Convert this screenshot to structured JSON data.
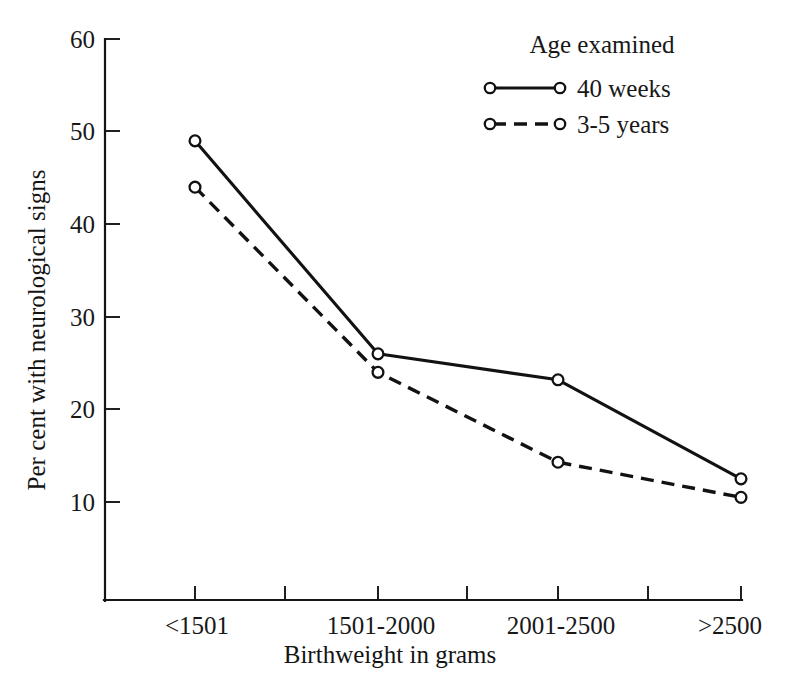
{
  "chart_data": {
    "type": "line",
    "title": "",
    "xlabel": "Birthweight in grams",
    "ylabel": "Per cent with neurological signs",
    "categories": [
      "<1501",
      "1501-2000",
      "2001-2500",
      ">2500"
    ],
    "yticks": [
      10,
      20,
      30,
      40,
      50,
      60
    ],
    "ytick_labels": [
      "10",
      "20",
      "30",
      "40",
      "50",
      "60"
    ],
    "ylim": [
      0,
      60
    ],
    "grid": false,
    "legend_position": "top-right",
    "legend_title": "Age examined",
    "series": [
      {
        "name": "40 weeks",
        "style": "solid",
        "marker": "open-circle",
        "values": [
          49,
          26,
          23.2,
          12.5
        ]
      },
      {
        "name": "3-5 years",
        "style": "dashed",
        "marker": "open-circle",
        "values": [
          44,
          24,
          14.3,
          10.5
        ]
      }
    ],
    "colors": {
      "line": "#121212",
      "axis": "#151515",
      "text": "#181818",
      "background": "#ffffff"
    }
  },
  "axis": {
    "x_title": "Birthweight in grams",
    "y_title": "Per cent with neurological signs",
    "ytick_60": "60",
    "ytick_50": "50",
    "ytick_40": "40",
    "ytick_30": "30",
    "ytick_20": "20",
    "ytick_10": "10",
    "xtick_1": "<1501",
    "xtick_2": "1501-2000",
    "xtick_3": "2001-2500",
    "xtick_4": ">2500"
  },
  "legend": {
    "title": "Age examined",
    "entry_1_label": "40 weeks",
    "entry_2_label": "3-5 years"
  }
}
